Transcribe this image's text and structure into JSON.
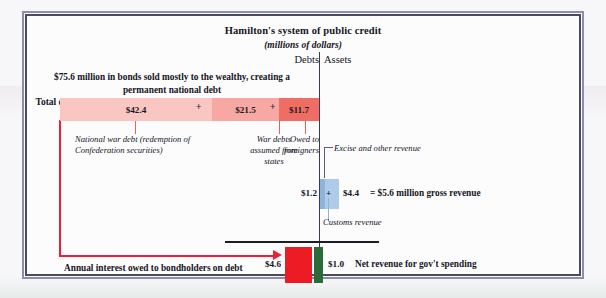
{
  "figure": {
    "title": "Hamilton's system of public credit",
    "subtitle": "(millions of dollars)",
    "axis_labels": {
      "left": "Debts",
      "right": "Assets"
    },
    "bonds_caption": "$75.6 million in bonds sold mostly to the wealthy, creating a permanent national debt",
    "total_debt_label": "Total debt",
    "interest_caption": "Annual interest owed to bondholders on debt",
    "net_revenue_caption": "Net revenue for gov't spending",
    "gross_revenue_total": "= $5.6 million gross revenue",
    "operators": {
      "plus": "+"
    },
    "colors": {
      "debt_national": "#f9c6c2",
      "debt_states": "#f7a8a2",
      "debt_foreign": "#ef6d62",
      "revenue_excise": "#aeccea",
      "revenue_customs": "#8db5da",
      "interest_bar": "#ed1c24",
      "net_revenue_bar": "#2a6b39",
      "pointer_red": "#ec1f39",
      "frame_outer": "#8d8da8",
      "frame_inner": "#4a4a63"
    }
  },
  "chart_data": {
    "type": "bar",
    "title": "Hamilton's system of public credit",
    "subtitle": "(millions of dollars)",
    "units": "millions of dollars",
    "xlabel": "",
    "ylabel": "",
    "grid": false,
    "legend": "inline annotations",
    "sides": {
      "debts_label": "Debts",
      "assets_label": "Assets"
    },
    "debts": {
      "total": 75.6,
      "total_label": "$75.6 million in bonds sold mostly to the wealthy, creating a permanent national debt",
      "categories": [
        "National war debt (redemption of Confederation securities)",
        "War debts assumed from states",
        "Owed to foreigners"
      ],
      "values": [
        42.4,
        21.5,
        11.7
      ],
      "value_labels": [
        "$42.4",
        "$21.5",
        "$11.7"
      ],
      "annual_interest": 4.6,
      "annual_interest_label": "$4.6",
      "annual_interest_caption": "Annual interest owed to bondholders on debt"
    },
    "assets": {
      "gross_revenue": 5.6,
      "gross_revenue_label": "= $5.6 million gross revenue",
      "categories": [
        "Customs revenue",
        "Excise and other revenue"
      ],
      "values": [
        1.2,
        4.4
      ],
      "value_labels": [
        "$1.2",
        "$4.4"
      ],
      "net_revenue": 1.0,
      "net_revenue_label": "$1.0",
      "net_revenue_caption": "Net revenue for gov't spending"
    }
  },
  "debt_segments": [
    {
      "value_label": "$42.4",
      "caption": "National war debt (redemption of Confederation securities)"
    },
    {
      "value_label": "$21.5",
      "caption": "War debts assumed from states"
    },
    {
      "value_label": "$11.7",
      "caption": "Owed to foreigners"
    }
  ],
  "revenue": {
    "customs_value": "$1.2",
    "customs_caption": "Customs revenue",
    "excise_value": "$4.4",
    "excise_caption": "Excise and other revenue"
  },
  "net_row": {
    "interest_value": "$4.6",
    "revenue_value": "$1.0"
  }
}
